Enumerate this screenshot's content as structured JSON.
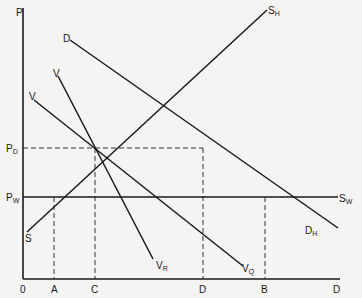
{
  "diagram": {
    "axis": {
      "y_label": "P",
      "origin_label": "0",
      "x_end_label": "D"
    },
    "price_labels": {
      "pd": {
        "main": "P",
        "sub": "D"
      },
      "pw": {
        "main": "P",
        "sub": "W"
      }
    },
    "x_ticks": [
      {
        "label": "A"
      },
      {
        "label": "C"
      },
      {
        "label": "D"
      },
      {
        "label": "B"
      }
    ],
    "curves": {
      "sh": {
        "start_label": "S",
        "end_main": "S",
        "end_sub": "H"
      },
      "dh": {
        "start_label": "D",
        "end_main": "D",
        "end_sub": "H"
      },
      "vr": {
        "start_label": "V",
        "end_main": "V",
        "end_sub": "R"
      },
      "vq": {
        "start_label": "V",
        "end_main": "V",
        "end_sub": "Q"
      },
      "sw": {
        "end_main": "S",
        "end_sub": "W"
      }
    }
  }
}
